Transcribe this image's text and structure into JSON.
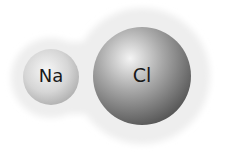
{
  "diagram": {
    "atoms": [
      {
        "symbol": "Na",
        "cx": 51,
        "cy": 77,
        "r": 28
      },
      {
        "symbol": "Cl",
        "cx": 142,
        "cy": 76,
        "r": 49
      }
    ],
    "colors": {
      "halo": "#f1f1f1",
      "na_light": "#f4f4f4",
      "na_dark": "#b5b5b5",
      "cl_light": "#f2f2f2",
      "cl_dark": "#5a5a5a"
    }
  }
}
